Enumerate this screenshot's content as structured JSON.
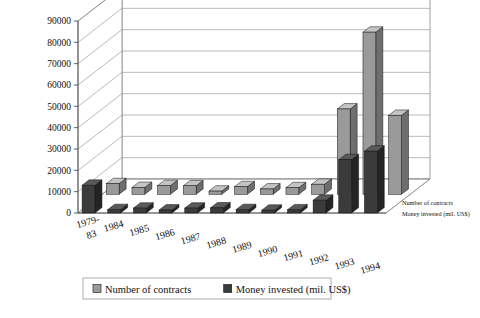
{
  "chart_data": {
    "type": "bar",
    "title": "",
    "subtitle": "",
    "xlabel": "",
    "ylabel": "",
    "ylim": [
      0,
      90000
    ],
    "ytick_step": 10000,
    "grid": true,
    "projection": "3d",
    "legend_position": "bottom",
    "categories": [
      "1979-83",
      "1984",
      "1985",
      "1986",
      "1987",
      "1988",
      "1989",
      "1990",
      "1991",
      "1992",
      "1993",
      "1994"
    ],
    "yticks": [
      "0",
      "10000",
      "20000",
      "30000",
      "40000",
      "50000",
      "60000",
      "70000",
      "80000",
      "90000"
    ],
    "series": [
      {
        "name": "Number of contracts",
        "color": "#9a9a9a",
        "side_color": "#6e6e6e",
        "top_color": "#c4c4c4",
        "values": [
          5000,
          3200,
          4100,
          4000,
          1500,
          3600,
          2500,
          3100,
          4700,
          40000,
          76000,
          37000
        ]
      },
      {
        "name": "Money invested (mil. US$)",
        "color": "#3b3b3b",
        "side_color": "#242424",
        "top_color": "#595959",
        "values": [
          13000,
          1600,
          2300,
          1400,
          2300,
          2400,
          1600,
          1300,
          1500,
          6000,
          25000,
          29000
        ]
      }
    ],
    "depth_axis_labels": [
      "Number of contracts",
      "Money invested (mil. US$)"
    ],
    "legend": [
      {
        "label": "Number of contracts",
        "color": "#9a9a9a"
      },
      {
        "label": "Money invested (mil. US$)",
        "color": "#3b3b3b"
      }
    ]
  }
}
